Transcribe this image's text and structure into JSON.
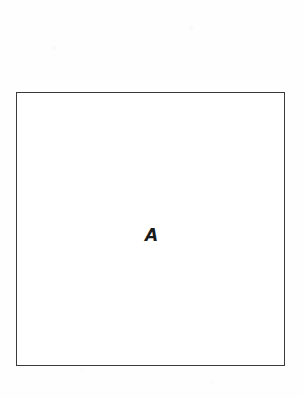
{
  "figure": {
    "kind": "geometric-figure",
    "canvas": {
      "width_px": 303,
      "height_px": 398,
      "background_color": "#fefefe"
    },
    "shape": {
      "type": "rectangle",
      "label": "A",
      "stroke_color": "#3a3a3a",
      "fill_color": "#ffffff",
      "stroke_width_px": 1.4,
      "bounds": {
        "left_px": 16,
        "top_px": 92,
        "width_px": 269,
        "height_px": 274
      }
    },
    "label": {
      "text": "A",
      "color": "#1a1a1a",
      "font_size_px": 17,
      "weight": "bold",
      "style": "italic",
      "center_x_px": 146,
      "center_y_px": 236
    }
  }
}
